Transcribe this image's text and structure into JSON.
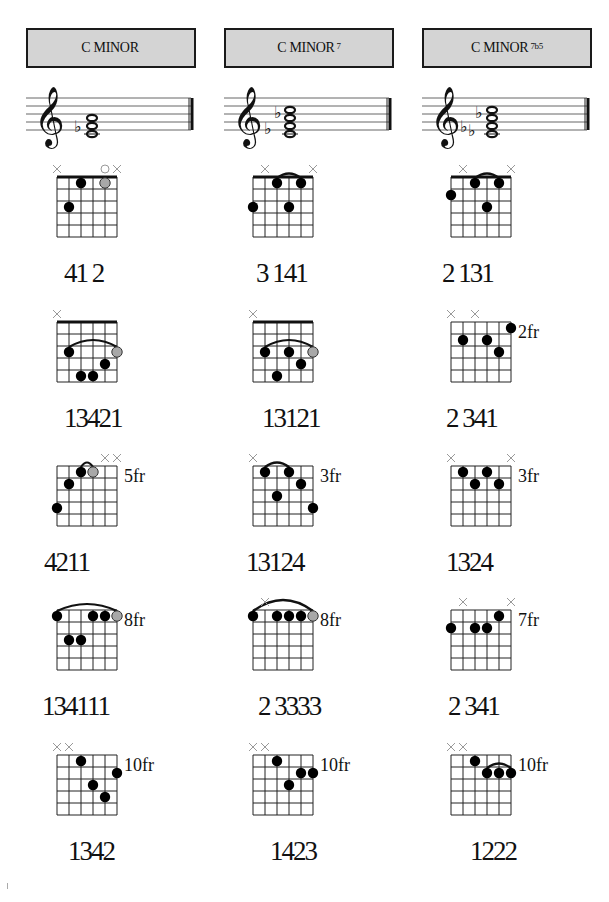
{
  "columns": [
    {
      "title": "C MINOR",
      "superscript": "",
      "flats": 1
    },
    {
      "title": "C MINOR",
      "superscript": "7",
      "flats": 2
    },
    {
      "title": "C MINOR",
      "superscript": "7b5",
      "flats": 2
    }
  ],
  "diagrams": [
    {
      "col": 0,
      "row": 0,
      "fret_label": "",
      "nut": true,
      "muted": [
        0,
        5
      ],
      "open": [
        4
      ],
      "dots": [
        {
          "s": 2,
          "f": 1
        },
        {
          "s": 4,
          "f": 1,
          "grey": true
        },
        {
          "s": 1,
          "f": 3
        }
      ],
      "barres": [],
      "fingering": "41 2"
    },
    {
      "col": 1,
      "row": 0,
      "fret_label": "",
      "nut": true,
      "muted": [
        1,
        5
      ],
      "open": [],
      "dots": [
        {
          "s": 2,
          "f": 1
        },
        {
          "s": 4,
          "f": 1
        },
        {
          "s": 0,
          "f": 3
        },
        {
          "s": 3,
          "f": 3
        }
      ],
      "barres": [
        {
          "from": 2,
          "to": 4,
          "f": 1
        }
      ],
      "fingering": "3 141"
    },
    {
      "col": 2,
      "row": 0,
      "fret_label": "",
      "nut": true,
      "muted": [
        1,
        5
      ],
      "open": [],
      "dots": [
        {
          "s": 2,
          "f": 1
        },
        {
          "s": 4,
          "f": 1
        },
        {
          "s": 0,
          "f": 2
        },
        {
          "s": 3,
          "f": 3
        }
      ],
      "barres": [
        {
          "from": 2,
          "to": 4,
          "f": 1
        }
      ],
      "fingering": "2 131"
    },
    {
      "col": 0,
      "row": 1,
      "fret_label": "",
      "nut": true,
      "muted": [
        0
      ],
      "open": [],
      "dots": [
        {
          "s": 1,
          "f": 3
        },
        {
          "s": 5,
          "f": 3,
          "grey": true
        },
        {
          "s": 4,
          "f": 4
        },
        {
          "s": 2,
          "f": 5
        },
        {
          "s": 3,
          "f": 5
        }
      ],
      "barres": [
        {
          "from": 1,
          "to": 5,
          "f": 3
        }
      ],
      "fingering": "13421"
    },
    {
      "col": 1,
      "row": 1,
      "fret_label": "",
      "nut": true,
      "muted": [
        0
      ],
      "open": [],
      "dots": [
        {
          "s": 1,
          "f": 3
        },
        {
          "s": 3,
          "f": 3
        },
        {
          "s": 5,
          "f": 3,
          "grey": true
        },
        {
          "s": 4,
          "f": 4
        },
        {
          "s": 2,
          "f": 5
        }
      ],
      "barres": [
        {
          "from": 1,
          "to": 5,
          "f": 3
        }
      ],
      "fingering": "13121"
    },
    {
      "col": 2,
      "row": 1,
      "fret_label": "2fr",
      "nut": false,
      "muted": [
        0,
        2
      ],
      "open": [],
      "dots": [
        {
          "s": 5,
          "f": 1
        },
        {
          "s": 1,
          "f": 2
        },
        {
          "s": 3,
          "f": 2
        },
        {
          "s": 4,
          "f": 3
        }
      ],
      "barres": [],
      "fingering": "2 341"
    },
    {
      "col": 0,
      "row": 2,
      "fret_label": "5fr",
      "nut": false,
      "muted": [
        4,
        5
      ],
      "open": [],
      "dots": [
        {
          "s": 2,
          "f": 1
        },
        {
          "s": 3,
          "f": 1,
          "grey": true
        },
        {
          "s": 1,
          "f": 2
        },
        {
          "s": 0,
          "f": 4
        }
      ],
      "barres": [
        {
          "from": 2,
          "to": 3,
          "f": 1
        }
      ],
      "fingering": "4211"
    },
    {
      "col": 1,
      "row": 2,
      "fret_label": "3fr",
      "nut": false,
      "muted": [
        0
      ],
      "open": [],
      "dots": [
        {
          "s": 1,
          "f": 1
        },
        {
          "s": 3,
          "f": 1
        },
        {
          "s": 4,
          "f": 2
        },
        {
          "s": 2,
          "f": 3
        },
        {
          "s": 5,
          "f": 4
        }
      ],
      "barres": [
        {
          "from": 1,
          "to": 3,
          "f": 1
        }
      ],
      "fingering": "13124"
    },
    {
      "col": 2,
      "row": 2,
      "fret_label": "3fr",
      "nut": false,
      "muted": [
        0,
        5
      ],
      "open": [],
      "dots": [
        {
          "s": 1,
          "f": 1
        },
        {
          "s": 3,
          "f": 1
        },
        {
          "s": 2,
          "f": 2
        },
        {
          "s": 4,
          "f": 2
        }
      ],
      "barres": [],
      "fingering": "1324"
    },
    {
      "col": 0,
      "row": 3,
      "fret_label": "8fr",
      "nut": false,
      "muted": [],
      "open": [],
      "dots": [
        {
          "s": 0,
          "f": 1
        },
        {
          "s": 3,
          "f": 1
        },
        {
          "s": 4,
          "f": 1
        },
        {
          "s": 5,
          "f": 1,
          "grey": true
        },
        {
          "s": 1,
          "f": 3
        },
        {
          "s": 2,
          "f": 3
        }
      ],
      "barres": [
        {
          "from": 0,
          "to": 5,
          "f": 1
        }
      ],
      "fingering": "134111"
    },
    {
      "col": 1,
      "row": 3,
      "fret_label": "8fr",
      "nut": false,
      "muted": [
        1
      ],
      "open": [],
      "dots": [
        {
          "s": 0,
          "f": 1
        },
        {
          "s": 2,
          "f": 1
        },
        {
          "s": 3,
          "f": 1
        },
        {
          "s": 4,
          "f": 1
        },
        {
          "s": 5,
          "f": 1,
          "grey": true
        }
      ],
      "barres": [
        {
          "from": 0,
          "to": 5,
          "f": 1,
          "high": true
        }
      ],
      "fingering": "2 3333"
    },
    {
      "col": 2,
      "row": 3,
      "fret_label": "7fr",
      "nut": false,
      "muted": [
        1,
        5
      ],
      "open": [],
      "dots": [
        {
          "s": 4,
          "f": 1
        },
        {
          "s": 0,
          "f": 2
        },
        {
          "s": 2,
          "f": 2
        },
        {
          "s": 3,
          "f": 2
        }
      ],
      "barres": [],
      "fingering": "2 341"
    },
    {
      "col": 0,
      "row": 4,
      "fret_label": "10fr",
      "nut": false,
      "muted": [
        0,
        1
      ],
      "open": [],
      "dots": [
        {
          "s": 2,
          "f": 1
        },
        {
          "s": 5,
          "f": 2
        },
        {
          "s": 3,
          "f": 3
        },
        {
          "s": 4,
          "f": 4
        }
      ],
      "barres": [],
      "fingering": "1342"
    },
    {
      "col": 1,
      "row": 4,
      "fret_label": "10fr",
      "nut": false,
      "muted": [
        0,
        1
      ],
      "open": [],
      "dots": [
        {
          "s": 2,
          "f": 1
        },
        {
          "s": 4,
          "f": 2
        },
        {
          "s": 5,
          "f": 2
        },
        {
          "s": 3,
          "f": 3
        }
      ],
      "barres": [],
      "fingering": "1423"
    },
    {
      "col": 2,
      "row": 4,
      "fret_label": "10fr",
      "nut": false,
      "muted": [
        0,
        1
      ],
      "open": [],
      "dots": [
        {
          "s": 2,
          "f": 1
        },
        {
          "s": 3,
          "f": 2
        },
        {
          "s": 4,
          "f": 2
        },
        {
          "s": 5,
          "f": 2
        }
      ],
      "barres": [
        {
          "from": 3,
          "to": 5,
          "f": 2
        }
      ],
      "fingering": "1222"
    }
  ],
  "colors": {
    "title_bg": "#d4d4d4",
    "dot": "#000000",
    "grey_dot": "#a8a8a8",
    "muted_mark": "#999999"
  }
}
